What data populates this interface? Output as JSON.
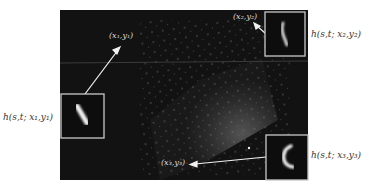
{
  "figure": {
    "colors": {
      "background": "#ffffff",
      "image_bg": "#121212",
      "inset_border": "#c8c8c8",
      "arrow": "#f2f2f2",
      "outer_text": "#333333",
      "inner_text": "#dddddd"
    },
    "points": [
      {
        "id": "p1",
        "label": "(x₁,y₁)",
        "psf_label": "h(s,t; x₁,y₁)"
      },
      {
        "id": "p2",
        "label": "(x₂,y₂)",
        "psf_label": "h(s,t; x₂,y₂)"
      },
      {
        "id": "p3",
        "label": "(x₃,y₃)",
        "psf_label": "h(s,t; x₃,y₃)"
      }
    ]
  }
}
